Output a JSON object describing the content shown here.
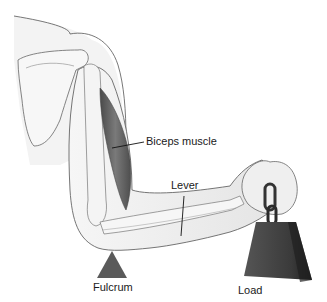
{
  "diagram": {
    "labels": {
      "biceps": "Biceps muscle",
      "lever": "Lever",
      "fulcrum": "Fulcrum",
      "load": "Load"
    },
    "parts": [
      "shoulder",
      "scapula",
      "humerus",
      "biceps-muscle",
      "forearm",
      "radius-ulna",
      "fist",
      "chain",
      "weight",
      "fulcrum-triangle"
    ],
    "colors": {
      "skin": "#ececec",
      "outline": "#6a6a6a",
      "muscle": "#5e5e5e",
      "bone": "#f2f2f2",
      "fulcrum": "#5a5a5a",
      "weight": "#3c3c3c",
      "weight_side": "#222222",
      "text": "#1a1a1a"
    }
  }
}
